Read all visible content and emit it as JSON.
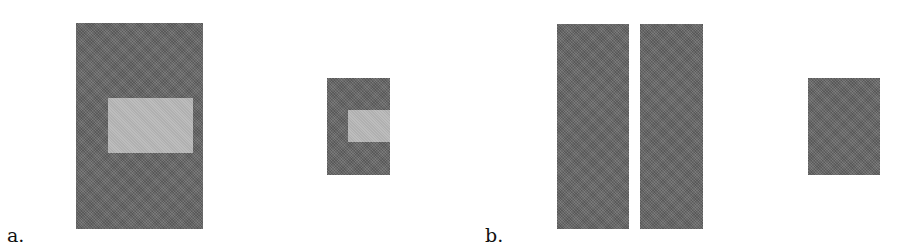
{
  "figure": {
    "panels": [
      {
        "label": "a.",
        "shapes": [
          {
            "name": "large-dark-rect",
            "tone": "dark",
            "x": 76,
            "y": 23,
            "w": 127,
            "h": 206
          },
          {
            "name": "large-inner-light-rect",
            "tone": "light",
            "x": 108,
            "y": 98,
            "w": 85,
            "h": 55
          },
          {
            "name": "small-dark-rect",
            "tone": "dark",
            "x": 327,
            "y": 78,
            "w": 63,
            "h": 97
          },
          {
            "name": "small-inner-light-rect",
            "tone": "light",
            "x": 348,
            "y": 110,
            "w": 42,
            "h": 32
          }
        ]
      },
      {
        "label": "b.",
        "shapes": [
          {
            "name": "tall-dark-rect-left",
            "tone": "dark",
            "x": 557,
            "y": 24,
            "w": 72,
            "h": 205
          },
          {
            "name": "tall-dark-rect-right",
            "tone": "dark",
            "x": 640,
            "y": 24,
            "w": 63,
            "h": 205
          },
          {
            "name": "small-dark-rect",
            "tone": "dark",
            "x": 808,
            "y": 78,
            "w": 72,
            "h": 97
          }
        ]
      }
    ],
    "colors": {
      "dark": "#6a6a6a",
      "light": "#b9b9b9",
      "background": "#ffffff"
    }
  }
}
